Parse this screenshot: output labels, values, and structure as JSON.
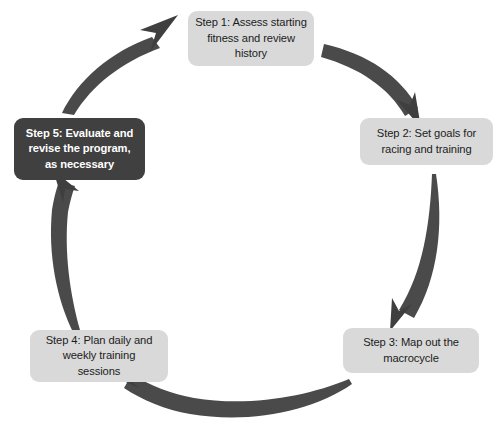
{
  "diagram": {
    "type": "cycle",
    "direction": "clockwise",
    "step_count": 5,
    "colors": {
      "box_fill": "#d9d9d9",
      "box_text": "#1c1c1c",
      "highlight_fill": "#404040",
      "highlight_text": "#ffffff",
      "arrow": "#4a4a4a",
      "background": "#ffffff"
    },
    "steps": [
      {
        "id": "step-1",
        "text": "Step 1:  Assess starting\nfitness and review\nhistory",
        "highlighted": false
      },
      {
        "id": "step-2",
        "text": "Step 2:  Set goals for\nracing and training",
        "highlighted": false
      },
      {
        "id": "step-3",
        "text": "Step 3:  Map out the\nmacrocycle",
        "highlighted": false
      },
      {
        "id": "step-4",
        "text": "Step 4:  Plan daily and\nweekly training\nsessions",
        "highlighted": false
      },
      {
        "id": "step-5",
        "text": "Step 5:  Evaluate and\nrevise the program,\nas necessary",
        "highlighted": true
      }
    ],
    "connectors": [
      {
        "id": "arrow-5-to-1",
        "from": "step-5",
        "to": "step-1"
      },
      {
        "id": "arrow-1-to-2",
        "from": "step-1",
        "to": "step-2"
      },
      {
        "id": "arrow-2-to-3",
        "from": "step-2",
        "to": "step-3"
      },
      {
        "id": "arrow-3-to-4",
        "from": "step-3",
        "to": "step-4"
      },
      {
        "id": "arrow-4-to-5",
        "from": "step-4",
        "to": "step-5"
      }
    ]
  }
}
